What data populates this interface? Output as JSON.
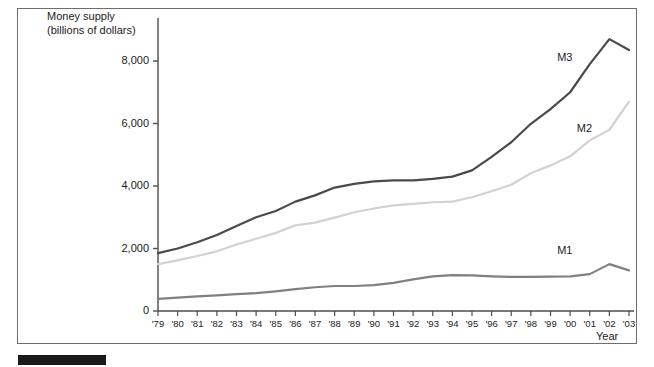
{
  "figure": {
    "y_axis_title_line1": "Money supply",
    "y_axis_title_line2": "(billions of dollars)",
    "x_axis_title": "Year",
    "label_m1": "M1",
    "label_m2": "M2",
    "label_m3": "M3",
    "colors": {
      "m1": "#808080",
      "m2": "#d2d2d2",
      "m3": "#4a4a4a",
      "axis": "#4d4d4d",
      "frame": "#6e6e6e",
      "text": "#1b1b1b",
      "black_bar": "#1a1a1a"
    }
  },
  "chart_data": {
    "type": "line",
    "title": "",
    "xlabel": "Year",
    "ylabel": "Money supply (billions of dollars)",
    "ylim": [
      0,
      9000
    ],
    "yticks": [
      0,
      2000,
      4000,
      6000,
      8000
    ],
    "ytick_labels": [
      "0",
      "2,000",
      "4,000",
      "6,000",
      "8,000"
    ],
    "grid": false,
    "legend": "inline-labels",
    "categories": [
      "'79",
      "'80",
      "'81",
      "'82",
      "'83",
      "'84",
      "'85",
      "'86",
      "'87",
      "'88",
      "'89",
      "'90",
      "'91",
      "'92",
      "'93",
      "'94",
      "'95",
      "'96",
      "'97",
      "'98",
      "'99",
      "'00",
      "'01",
      "'02",
      "'03"
    ],
    "series": [
      {
        "name": "M1",
        "color": "#808080",
        "values": [
          390,
          430,
          470,
          500,
          540,
          570,
          630,
          700,
          760,
          800,
          800,
          830,
          900,
          1010,
          1110,
          1150,
          1140,
          1110,
          1090,
          1090,
          1100,
          1110,
          1180,
          1500,
          1300
        ]
      },
      {
        "name": "M2",
        "color": "#d2d2d2",
        "values": [
          1500,
          1620,
          1760,
          1910,
          2130,
          2310,
          2500,
          2740,
          2830,
          2990,
          3160,
          3280,
          3380,
          3430,
          3480,
          3500,
          3640,
          3830,
          4040,
          4410,
          4660,
          4950,
          5460,
          5800,
          6700
        ]
      },
      {
        "name": "M3",
        "color": "#4a4a4a",
        "values": [
          1850,
          2000,
          2200,
          2430,
          2720,
          3000,
          3200,
          3500,
          3700,
          3950,
          4070,
          4150,
          4180,
          4180,
          4230,
          4300,
          4500,
          4930,
          5400,
          5990,
          6460,
          7000,
          7900,
          8700,
          8350
        ]
      }
    ],
    "annotations": [
      {
        "text": "M3",
        "x": "'00",
        "y": 8050
      },
      {
        "text": "M2",
        "x": "'01",
        "y": 5800
      },
      {
        "text": "M1",
        "x": "'00",
        "y": 1900
      }
    ]
  }
}
